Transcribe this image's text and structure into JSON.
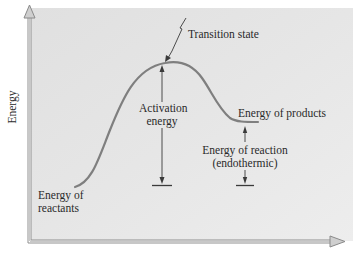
{
  "diagram": {
    "type": "energy-profile",
    "y_axis_label": "Energy",
    "labels": {
      "transition_state": "Transition state",
      "activation_energy_line1": "Activation",
      "activation_energy_line2": "energy",
      "energy_of_products": "Energy of products",
      "energy_of_reaction_line1": "Energy of reaction",
      "energy_of_reaction_line2": "(endothermic)",
      "energy_of_reactants_line1": "Energy of",
      "energy_of_reactants_line2": "reactants"
    },
    "colors": {
      "panel_background": "#e4e4e4",
      "axis": "#9a9a9a",
      "curve": "#7d7d7d",
      "text": "#2a2a2a",
      "arrow": "#3a3a3a"
    }
  }
}
